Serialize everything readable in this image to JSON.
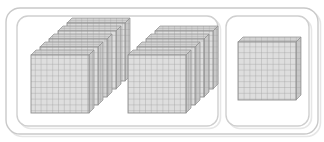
{
  "figure": {
    "kind": "base-ten-blocks-manipulative",
    "total_value": "1000"
  },
  "colors": {
    "page_background": "#ffffff",
    "outer_border": "#c9c9c9",
    "inner_border": "#cfcfcf",
    "flat_fill": "#dedede",
    "flat_grid_line": "#9a9a9a",
    "flat_outline": "#8f8f8f",
    "flat_top_face": "#d2d2d2",
    "flat_side_face": "#c8c8c8",
    "shadow": "#e6e6e6"
  },
  "outer_container": {
    "label": "outer-rounded-frame",
    "x": 6,
    "y": 8,
    "width": 312,
    "height": 126,
    "radius": 14
  },
  "boxes": [
    {
      "name": "left-box",
      "label": "hundreds-box-nine",
      "x": 17,
      "y": 16,
      "width": 201,
      "height": 110,
      "radius": 11,
      "value": "900",
      "flat_count": 9
    },
    {
      "name": "right-box",
      "label": "hundreds-box-one",
      "x": 226,
      "y": 16,
      "width": 83,
      "height": 110,
      "radius": 11,
      "value": "100",
      "flat_count": 1
    }
  ],
  "stacks": [
    {
      "name": "stack-left-five",
      "box": "left-box",
      "flat_count": 5,
      "value": "500",
      "front_x": 31,
      "front_y": 55,
      "flat_size": 58,
      "step_x": 9,
      "step_y": -8,
      "grid_rows": 10,
      "grid_cols": 10
    },
    {
      "name": "stack-left-four",
      "box": "left-box",
      "flat_count": 4,
      "value": "400",
      "front_x": 128,
      "front_y": 55,
      "flat_size": 58,
      "step_x": 9,
      "step_y": -8,
      "grid_rows": 10,
      "grid_cols": 10
    },
    {
      "name": "stack-right-one",
      "box": "right-box",
      "flat_count": 1,
      "value": "100",
      "front_x": 238,
      "front_y": 42,
      "flat_size": 58,
      "step_x": 0,
      "step_y": 0,
      "grid_rows": 10,
      "grid_cols": 10
    }
  ],
  "legend": {
    "flat_unit_name": "hundred-flat",
    "flat_unit_value": "100",
    "cell_unit_name": "unit-cube",
    "cell_unit_value": "1"
  }
}
